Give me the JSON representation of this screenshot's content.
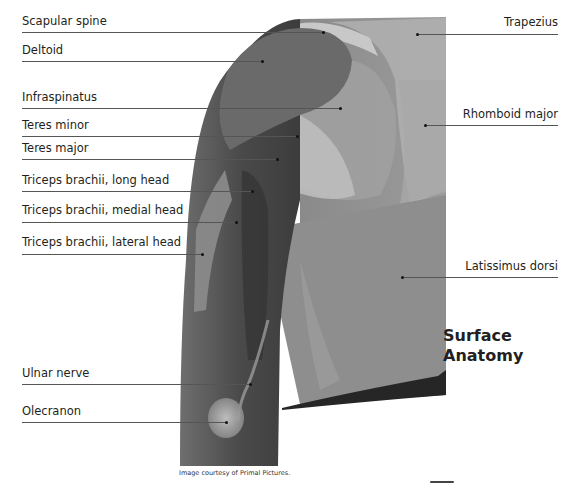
{
  "diagram": {
    "title_line1": "Surface",
    "title_line2": "Anatomy",
    "credit": "Image courtesy of Primal Pictures.",
    "colors": {
      "background": "#ffffff",
      "text": "#231f20",
      "leader": "#555555",
      "figure_light": "#b4b4b4",
      "figure_mid": "#8c8c8c",
      "figure_dark": "#555555",
      "figure_shadow": "#2a2a2a"
    },
    "labels_left": [
      {
        "text": "Scapular spine"
      },
      {
        "text": "Deltoid"
      },
      {
        "text": "Infraspinatus"
      },
      {
        "text": "Teres minor"
      },
      {
        "text": "Teres major"
      },
      {
        "text": "Triceps brachii, long head"
      },
      {
        "text": "Triceps brachii, medial head"
      },
      {
        "text": "Triceps brachii, lateral head"
      },
      {
        "text": "Ulnar nerve"
      },
      {
        "text": "Olecranon"
      }
    ],
    "labels_right": [
      {
        "text": "Trapezius"
      },
      {
        "text": "Rhomboid major"
      },
      {
        "text": "Latissimus dorsi"
      }
    ]
  }
}
